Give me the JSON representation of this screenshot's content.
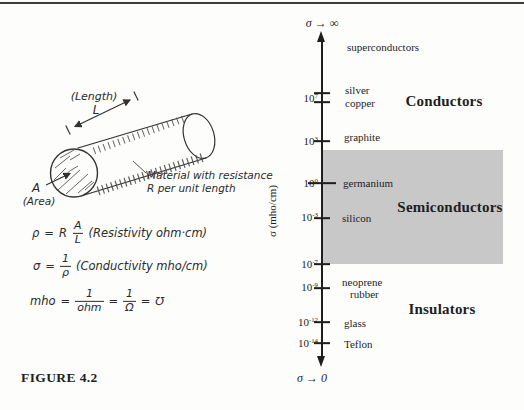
{
  "page": {
    "background": "#fdfdfc",
    "top_rule_color": "#3c3c3c"
  },
  "caption": "FIGURE 4.2",
  "drawing": {
    "length_label": "(Length)",
    "length_symbol": "L",
    "area_symbol": "A",
    "area_label": "(Area)",
    "material_note_line1": "Material with resistance",
    "material_note_line2": "R per unit length"
  },
  "formulas": {
    "eq": "=",
    "rho": {
      "lhs": "ρ",
      "coef": "R",
      "num": "A",
      "den": "L",
      "note": "(Resistivity ohm·cm)"
    },
    "sigma": {
      "lhs": "σ",
      "num": "1",
      "den": "ρ",
      "note": "(Conductivity mho/cm)"
    },
    "mho": {
      "lhs": "mho",
      "num1": "1",
      "den1": "ohm",
      "num2": "1",
      "den2": "Ω",
      "result": "℧"
    }
  },
  "chart": {
    "top_label": "σ → ∞",
    "bottom_label": "σ → 0",
    "axis_label": "σ (mho/cm)",
    "band_color": "#c8c8c8",
    "regions": [
      {
        "name": "Conductors",
        "x": 444,
        "y": 101
      },
      {
        "name": "Semiconductors",
        "x": 450,
        "y": 207
      },
      {
        "name": "Insulators",
        "x": 442,
        "y": 309
      }
    ],
    "tick_labels": [
      {
        "base": "10",
        "exp": "7",
        "y": 98
      },
      {
        "base": "10",
        "exp": "3",
        "y": 141
      },
      {
        "base": "10",
        "exp": "0",
        "y": 183
      },
      {
        "base": "10",
        "exp": "-3",
        "y": 217
      },
      {
        "base": "10",
        "exp": "-7",
        "y": 264
      },
      {
        "base": "10",
        "exp": "-9",
        "y": 287
      },
      {
        "base": "10",
        "exp": "-12",
        "y": 322
      },
      {
        "base": "10",
        "exp": "-14",
        "y": 343
      }
    ],
    "tick_marks": [
      {
        "y": 93
      },
      {
        "y": 102
      },
      {
        "y": 141
      },
      {
        "y": 183,
        "w": 28
      },
      {
        "y": 218
      },
      {
        "y": 264
      },
      {
        "y": 288
      },
      {
        "y": 322
      },
      {
        "y": 343
      }
    ],
    "materials": [
      {
        "name": "superconductors",
        "x": 347,
        "y": 47
      },
      {
        "name": "silver",
        "x": 345,
        "y": 90
      },
      {
        "name": "copper",
        "x": 345,
        "y": 103
      },
      {
        "name": "graphite",
        "x": 344,
        "y": 137
      },
      {
        "name": "germanium",
        "x": 343,
        "y": 183
      },
      {
        "name": "silicon",
        "x": 342,
        "y": 218
      },
      {
        "name": "neoprene",
        "x": 342,
        "y": 282
      },
      {
        "name": "rubber",
        "x": 350,
        "y": 294
      },
      {
        "name": "glass",
        "x": 344,
        "y": 323
      },
      {
        "name": "Teflon",
        "x": 344,
        "y": 344
      }
    ]
  },
  "chart_data": {
    "type": "log-scale-axis",
    "axis_label": "σ (mho/cm)",
    "orientation": "vertical",
    "limits": {
      "top": "σ → ∞",
      "bottom": "σ → 0"
    },
    "tick_values": [
      "1e7",
      "1e3",
      "1e0",
      "1e-3",
      "1e-7",
      "1e-9",
      "1e-12",
      "1e-14"
    ],
    "regions": [
      {
        "name": "Conductors",
        "approx_range_mho_per_cm": "> 1e3",
        "materials": [
          "superconductors",
          "silver",
          "copper",
          "graphite"
        ],
        "shaded": false
      },
      {
        "name": "Semiconductors",
        "approx_range_mho_per_cm": "1e3 to 1e-7",
        "materials": [
          "germanium",
          "silicon"
        ],
        "shaded": true
      },
      {
        "name": "Insulators",
        "approx_range_mho_per_cm": "< 1e-7",
        "materials": [
          "neoprene",
          "rubber",
          "glass",
          "Teflon"
        ],
        "shaded": false
      }
    ]
  }
}
